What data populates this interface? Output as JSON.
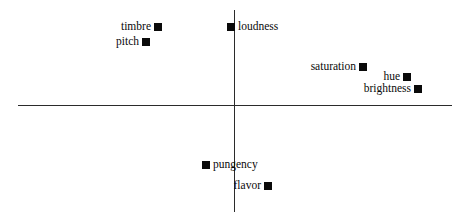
{
  "chart_data": {
    "type": "scatter",
    "title": "",
    "xlabel": "",
    "ylabel": "",
    "grid": false,
    "legend": "none",
    "axes": {
      "style": "crossed-origin-axes",
      "origin_px": {
        "x": 234,
        "y": 105
      },
      "x_axis_px": {
        "start": 18,
        "end": 452,
        "y": 105
      },
      "y_axis_px": {
        "start": 10,
        "end": 212,
        "x": 234
      },
      "xlim": [
        -1.0,
        1.0
      ],
      "ylim": [
        -1.0,
        1.0
      ],
      "ticks": "none"
    },
    "marker_style": {
      "shape": "square",
      "size_px": 8,
      "color": "#0a0a0a"
    },
    "points": [
      {
        "label": "timbre",
        "px": {
          "x": 158,
          "y": 27
        },
        "xy": [
          -0.35,
          0.77
        ],
        "label_side": "left"
      },
      {
        "label": "pitch",
        "px": {
          "x": 146,
          "y": 42
        },
        "xy": [
          -0.41,
          0.62
        ],
        "label_side": "left"
      },
      {
        "label": "loudness",
        "px": {
          "x": 231,
          "y": 27
        },
        "xy": [
          -0.01,
          0.77
        ],
        "label_side": "right"
      },
      {
        "label": "saturation",
        "px": {
          "x": 363,
          "y": 67
        },
        "xy": [
          0.59,
          0.38
        ],
        "label_side": "left"
      },
      {
        "label": "hue",
        "px": {
          "x": 407,
          "y": 77
        },
        "xy": [
          0.79,
          0.28
        ],
        "label_side": "left"
      },
      {
        "label": "brightness",
        "px": {
          "x": 418,
          "y": 89
        },
        "xy": [
          0.84,
          0.16
        ],
        "label_side": "left"
      },
      {
        "label": "pungency",
        "px": {
          "x": 206,
          "y": 165
        },
        "xy": [
          -0.13,
          -0.59
        ],
        "label_side": "right"
      },
      {
        "label": "flavor",
        "px": {
          "x": 268,
          "y": 186
        },
        "xy": [
          0.16,
          -0.8
        ],
        "label_side": "left"
      }
    ]
  },
  "colors": {
    "axis": "#2b2b2b",
    "marker": "#0a0a0a",
    "text": "#0a0a0a",
    "background": "#ffffff"
  }
}
